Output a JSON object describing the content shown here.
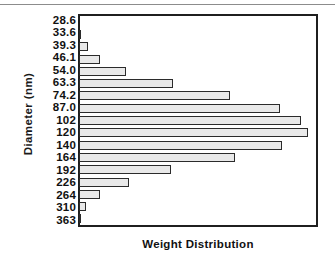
{
  "chart_data": {
    "type": "bar",
    "orientation": "horizontal",
    "title": "",
    "xlabel": "Weight  Distribution",
    "ylabel": "Diameter  (nm)",
    "categories": [
      "28.6",
      "33.6",
      "39.3",
      "46.1",
      "54.0",
      "63.3",
      "74.2",
      "87.0",
      "102",
      "120",
      "140",
      "164",
      "192",
      "226",
      "264",
      "310",
      "363"
    ],
    "values": [
      0,
      1,
      4,
      9,
      20,
      40,
      64,
      85,
      94,
      97,
      86,
      66,
      39,
      21,
      9,
      3,
      1
    ],
    "value_unit": "relative weight (%)",
    "xlim": [
      0,
      100
    ],
    "grid": false,
    "legend": null,
    "bar_fill_color": "#e9e9e9",
    "bar_edge_color": "#2b2b2b",
    "frame_color": "#1f1f1f"
  }
}
